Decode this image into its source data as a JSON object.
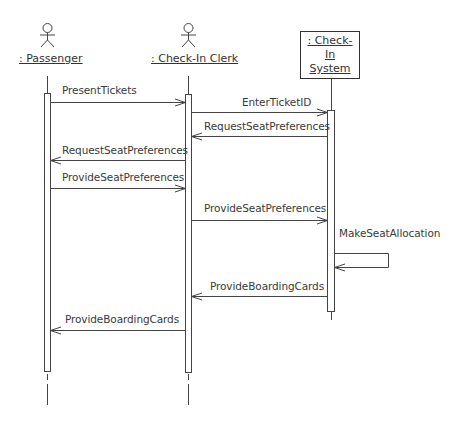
{
  "diagram": {
    "type": "UML sequence diagram",
    "participants": [
      {
        "id": "passenger",
        "label": ": Passenger",
        "kind": "actor"
      },
      {
        "id": "clerk",
        "label": ": Check-In Clerk",
        "kind": "actor"
      },
      {
        "id": "system",
        "label_line1": ": Check-In",
        "label_line2": "System",
        "kind": "object"
      }
    ],
    "messages": [
      {
        "from": "passenger",
        "to": "clerk",
        "label": "PresentTickets"
      },
      {
        "from": "clerk",
        "to": "system",
        "label": "EnterTicketID"
      },
      {
        "from": "system",
        "to": "clerk",
        "label": "RequestSeatPreferences"
      },
      {
        "from": "clerk",
        "to": "passenger",
        "label": "RequestSeatPreferences"
      },
      {
        "from": "passenger",
        "to": "clerk",
        "label": "ProvideSeatPreferences"
      },
      {
        "from": "clerk",
        "to": "system",
        "label": "ProvideSeatPreferences"
      },
      {
        "from": "system",
        "to": "system",
        "label": "MakeSeatAllocation"
      },
      {
        "from": "system",
        "to": "clerk",
        "label": "ProvideBoardingCards"
      },
      {
        "from": "clerk",
        "to": "passenger",
        "label": "ProvideBoardingCards"
      }
    ]
  }
}
